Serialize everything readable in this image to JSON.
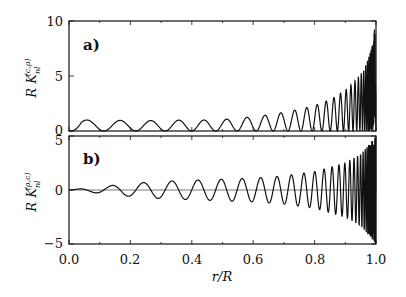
{
  "chart_data": [
    {
      "type": "line",
      "panel_label": "a)",
      "ylabel": "R K_nl^(c,ρ)",
      "xlabel": "",
      "xlim": [
        0.0,
        1.0
      ],
      "ylim": [
        0,
        10
      ],
      "yticks": [
        "0",
        "5",
        "10"
      ],
      "xticks": [],
      "grid": false,
      "series": [
        {
          "name": "R K_nl^(c,rho)",
          "peaks_x": [
            0.09,
            0.2,
            0.3,
            0.38,
            0.46,
            0.53,
            0.6,
            0.66,
            0.72,
            0.77,
            0.82,
            0.86,
            0.9,
            0.93,
            0.96,
            0.98,
            0.99,
            1.0
          ],
          "peaks_y": [
            1.0,
            0.95,
            0.95,
            1.0,
            1.0,
            1.1,
            1.3,
            1.5,
            1.8,
            2.1,
            2.5,
            3.0,
            3.7,
            4.5,
            5.5,
            7.0,
            8.5,
            10.0
          ]
        }
      ]
    },
    {
      "type": "line",
      "panel_label": "b)",
      "ylabel": "R K_nl^(ρ,c)",
      "xlabel": "r/R",
      "xlim": [
        0.0,
        1.0
      ],
      "ylim": [
        -5,
        5
      ],
      "yticks": [
        "−5",
        "0",
        "5"
      ],
      "xticks": [
        "0.0",
        "0.2",
        "0.4",
        "0.6",
        "0.8",
        "1.0"
      ],
      "grid": false,
      "series": [
        {
          "name": "R K_nl^(rho,c)",
          "x": [
            0.0,
            0.1,
            0.2,
            0.3,
            0.4,
            0.5,
            0.6,
            0.7,
            0.8,
            0.9,
            0.95,
            1.0
          ],
          "amplitude": [
            0.0,
            0.3,
            0.6,
            0.8,
            0.9,
            1.0,
            1.1,
            1.3,
            1.7,
            2.5,
            3.3,
            5.0
          ]
        }
      ]
    }
  ],
  "labels": {
    "panel_a": "a)",
    "panel_b": "b)",
    "ylabel_a_main": "R  K",
    "ylabel_a_sup": "(c,ρ)",
    "ylabel_a_sub": "nl",
    "ylabel_b_main": "R  K",
    "ylabel_b_sup": "(ρ,c)",
    "ylabel_b_sub": "nl",
    "xlabel": "r/R",
    "ya_ticks": [
      "0",
      "5",
      "10"
    ],
    "yb_ticks": [
      "−5",
      "0",
      "5"
    ],
    "x_ticks": [
      "0.0",
      "0.2",
      "0.4",
      "0.6",
      "0.8",
      "1.0"
    ]
  }
}
